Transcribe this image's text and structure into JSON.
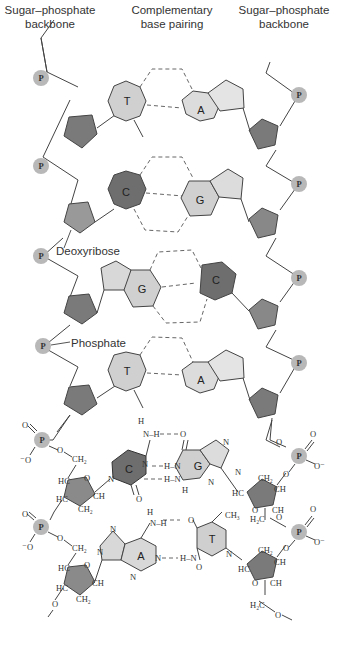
{
  "headers": {
    "left_line1": "Sugar–phosphate",
    "left_line2": "backbone",
    "center_line1": "Complementary",
    "center_line2": "base pairing",
    "right_line1": "Sugar–phosphate",
    "right_line2": "backbone"
  },
  "annotations": {
    "deoxyribose": "Deoxyribose",
    "phosphate": "Phosphate"
  },
  "phosphate_symbol": "P",
  "colors": {
    "phosphate": "#b8b8b8",
    "sugar": "#8a8a8a",
    "base_light": "#d6d6d6",
    "base_dark": "#6e6e6e",
    "line": "#444444"
  },
  "schematic_pairs": [
    {
      "left": "T",
      "right": "A"
    },
    {
      "left": "C",
      "right": "G"
    },
    {
      "left": "G",
      "right": "C"
    },
    {
      "left": "T",
      "right": "A"
    }
  ],
  "chemical_pairs": [
    {
      "left": "C",
      "right": "G"
    },
    {
      "left": "A",
      "right": "T"
    }
  ],
  "chem_labels": {
    "O": "O",
    "O_minus": "⁻O",
    "O_minus_r": "O⁻",
    "CH2": "CH₂",
    "CH": "CH",
    "HC": "HC",
    "H2C": "H₂C",
    "N": "N",
    "H": "H",
    "NH": "N–H",
    "HN": "H–N",
    "CH3": "CH₃"
  }
}
